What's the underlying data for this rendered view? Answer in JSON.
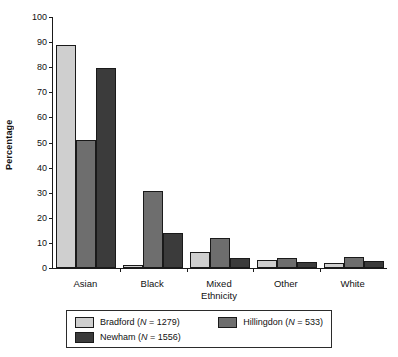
{
  "chart_data": {
    "type": "bar",
    "title": "",
    "xlabel": "Ethnicity",
    "ylabel": "Percentage",
    "ylim": [
      0,
      100
    ],
    "yticks": [
      0,
      10,
      20,
      30,
      40,
      50,
      60,
      70,
      80,
      90,
      100
    ],
    "grid": false,
    "legend_position": "bottom",
    "categories": [
      "Asian",
      "Black",
      "Mixed",
      "Other",
      "White"
    ],
    "series": [
      {
        "name": "Bradford",
        "legend_label": "Bradford (N = 1279)",
        "n": 1279,
        "color": "#cfcfcf",
        "values": [
          89.0,
          1.3,
          6.2,
          3.1,
          1.8
        ]
      },
      {
        "name": "Hillingdon",
        "legend_label": "Hillingdon (N = 533)",
        "n": 533,
        "color": "#6e6e6e",
        "values": [
          51.2,
          30.7,
          12.1,
          3.8,
          4.5
        ]
      },
      {
        "name": "Newham",
        "legend_label": "Newham (N = 1556)",
        "n": 1556,
        "color": "#3b3b3b",
        "values": [
          79.5,
          13.9,
          3.9,
          2.5,
          2.9
        ]
      }
    ]
  },
  "axis": {
    "ylabel": "Percentage",
    "xlabel": "Ethnicity",
    "ytick_labels": [
      "0",
      "10",
      "20",
      "30",
      "40",
      "50",
      "60",
      "70",
      "80",
      "90",
      "100"
    ],
    "xtick_labels": [
      "Asian",
      "Black",
      "Mixed",
      "Other",
      "White"
    ]
  },
  "legend": {
    "entries": [
      {
        "label_prefix": "Bradford (",
        "italic": "N",
        "label_suffix": " = 1279)",
        "color": "#cfcfcf"
      },
      {
        "label_prefix": "Hillingdon (",
        "italic": "N",
        "label_suffix": " = 533)",
        "color": "#6e6e6e"
      },
      {
        "label_prefix": "Newham (",
        "italic": "N",
        "label_suffix": " = 1556)",
        "color": "#3b3b3b"
      }
    ]
  }
}
